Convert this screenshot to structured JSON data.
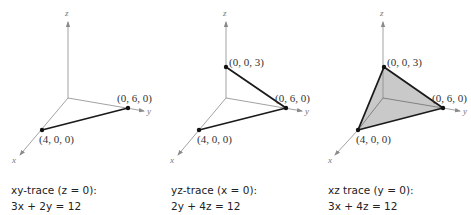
{
  "panels": [
    {
      "id": "xy-trace",
      "axes": {
        "x": "x",
        "y": "y",
        "z": "z"
      },
      "points": [
        {
          "label": "(0, 6, 0)"
        },
        {
          "label": "(4, 0, 0)"
        }
      ],
      "caption": {
        "line1": "xy-trace (z = 0):",
        "line2": "3x + 2y = 12"
      }
    },
    {
      "id": "yz-trace",
      "axes": {
        "x": "x",
        "y": "y",
        "z": "z"
      },
      "points": [
        {
          "label": "(0, 0, 3)"
        },
        {
          "label": "(0, 6, 0)"
        },
        {
          "label": "(4, 0, 0)"
        }
      ],
      "caption": {
        "line1": "yz-trace (x = 0):",
        "line2": "2y + 4z = 12"
      }
    },
    {
      "id": "xz-trace",
      "axes": {
        "x": "x",
        "y": "y",
        "z": "z"
      },
      "points": [
        {
          "label": "(0, 0, 3)"
        },
        {
          "label": "(0, 6, 0)"
        },
        {
          "label": "(4, 0, 0)"
        }
      ],
      "caption": {
        "line1": "xz trace (y = 0):",
        "line2": "3x + 4z = 12"
      }
    }
  ],
  "colors": {
    "axis": "#8a8a8a",
    "trace": "#1a1a1a",
    "fill": "#c9c9c9"
  }
}
